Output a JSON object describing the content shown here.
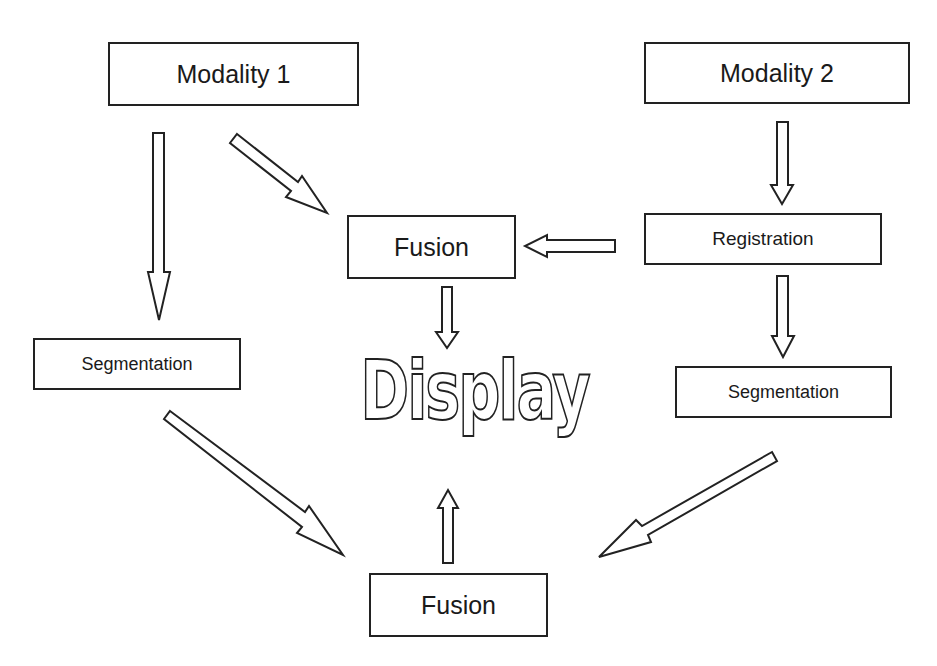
{
  "diagram": {
    "nodes": [
      {
        "id": "modality1",
        "label": "Modality 1"
      },
      {
        "id": "modality2",
        "label": "Modality 2"
      },
      {
        "id": "fusion_top",
        "label": "Fusion"
      },
      {
        "id": "registration",
        "label": "Registration"
      },
      {
        "id": "segmentation_left",
        "label": "Segmentation"
      },
      {
        "id": "segmentation_right",
        "label": "Segmentation"
      },
      {
        "id": "display",
        "label": "Display"
      },
      {
        "id": "fusion_bottom",
        "label": "Fusion"
      }
    ],
    "edges": [
      {
        "from": "modality1",
        "to": "segmentation_left"
      },
      {
        "from": "modality1",
        "to": "fusion_top"
      },
      {
        "from": "modality2",
        "to": "registration"
      },
      {
        "from": "registration",
        "to": "fusion_top"
      },
      {
        "from": "registration",
        "to": "segmentation_right"
      },
      {
        "from": "fusion_top",
        "to": "display"
      },
      {
        "from": "segmentation_left",
        "to": "fusion_bottom"
      },
      {
        "from": "segmentation_right",
        "to": "fusion_bottom"
      },
      {
        "from": "fusion_bottom",
        "to": "display"
      }
    ],
    "colors": {
      "stroke": "#222222",
      "fill": "#ffffff",
      "background": "#ffffff"
    }
  }
}
